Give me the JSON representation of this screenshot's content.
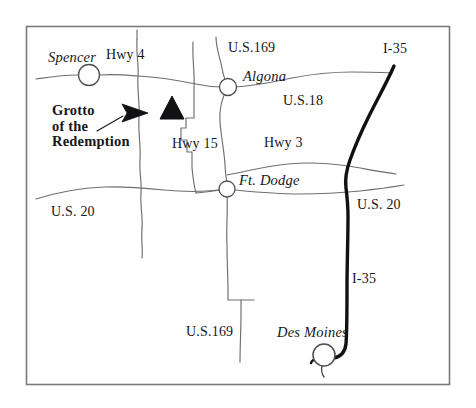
{
  "map": {
    "title": "Grotto of the Redemption Location Map",
    "frame": {
      "border_color": "#7a7a7e",
      "background": "#ffffff"
    },
    "colors": {
      "road_minor": "#6e6e73",
      "road_major": "#111114",
      "text": "#16161a",
      "marker_fill": "#111114",
      "city_circle_stroke": "#4e4e52"
    },
    "poi": {
      "name_line1": "Grotto",
      "name_line2": "of the",
      "name_line3": "Redemption",
      "marker_type": "triangle",
      "pointer_type": "arrow"
    },
    "cities": [
      {
        "name": "Spencer",
        "marker": "circle"
      },
      {
        "name": "Algona",
        "marker": "circle"
      },
      {
        "name": "Ft. Dodge",
        "marker": "circle"
      },
      {
        "name": "Des Moines",
        "marker": "circle"
      }
    ],
    "roads": [
      {
        "label": "Hwy 4",
        "kind": "state"
      },
      {
        "label": "Hwy 15",
        "kind": "state"
      },
      {
        "label": "Hwy 3",
        "kind": "state"
      },
      {
        "label": "U.S.169",
        "kind": "us"
      },
      {
        "label": "U.S.18",
        "kind": "us"
      },
      {
        "label": "U.S. 20",
        "kind": "us"
      },
      {
        "label": "U.S. 20",
        "kind": "us"
      },
      {
        "label": "U.S.169",
        "kind": "us"
      },
      {
        "label": "I-35",
        "kind": "interstate"
      },
      {
        "label": "I-35",
        "kind": "interstate"
      }
    ],
    "labels": {
      "spencer": "Spencer",
      "hwy4": "Hwy 4",
      "us169_top": "U.S.169",
      "i35_top": "I-35",
      "algona": "Algona",
      "us18": "U.S.18",
      "hwy15": "Hwy 15",
      "hwy3": "Hwy 3",
      "ft_dodge": "Ft. Dodge",
      "us20_left": "U.S. 20",
      "us20_right": "U.S. 20",
      "i35_bottom": "I-35",
      "us169_bottom": "U.S.169",
      "des_moines": "Des Moines",
      "grotto_1": "Grotto",
      "grotto_2": "of the",
      "grotto_3": "Redemption"
    }
  }
}
